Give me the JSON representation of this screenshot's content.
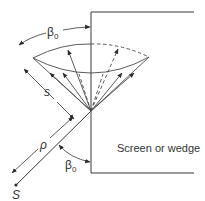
{
  "figure": {
    "type": "diffraction geometry diagram",
    "labels": {
      "beta_top": "β",
      "beta_top_sub": "0",
      "s": "s",
      "rho": "ρ",
      "beta_bottom": "β",
      "beta_bottom_sub": "0",
      "source": "S",
      "screen": "Screen or wedge"
    },
    "elements": {
      "screen_edge": "vertical edge of screen/wedge with top and bottom boundaries",
      "cone": "cone of diffracted rays with apex at edge",
      "incident_ray": "ray from source S to edge point",
      "rays_solid": 6,
      "rays_dashed": 2
    },
    "colors": {
      "line": "#3a3a3a",
      "text": "#333333",
      "background": "#ffffff"
    }
  }
}
